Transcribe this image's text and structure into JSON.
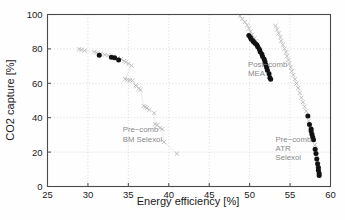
{
  "chart_data": {
    "type": "scatter",
    "title": "",
    "xlabel": "Energy efficiency [%]",
    "ylabel": "CO2 capture [%]",
    "xlim": [
      25,
      60
    ],
    "ylim": [
      0,
      100
    ],
    "xticks": [
      25,
      30,
      35,
      40,
      45,
      50,
      55,
      60
    ],
    "yticks": [
      0,
      20,
      40,
      60,
      80,
      100
    ],
    "grid": true,
    "legend_position": "inline-annotations",
    "marker_colors": {
      "light": "#b8b8b8",
      "dark": "#121212",
      "grid": "#cfcfcf",
      "axis": "#4a4a4a"
    },
    "series": [
      {
        "name": "Pre-comb BM Selexol",
        "annotation_lines": [
          "Pre−comb",
          "BM Selexol"
        ],
        "annotation_x": 34.3,
        "annotation_y": 31.5,
        "marker_light": "x",
        "marker_dark": "circle",
        "points_light": [
          [
            28.9,
            79.8
          ],
          [
            29.2,
            79.5
          ],
          [
            29.6,
            79.0
          ],
          [
            30.8,
            78.2
          ],
          [
            31.1,
            77.8
          ],
          [
            31.6,
            77.3
          ],
          [
            32.1,
            76.6
          ],
          [
            32.5,
            76.2
          ],
          [
            33.7,
            74.6
          ],
          [
            34.1,
            74.1
          ],
          [
            34.5,
            72.9
          ],
          [
            34.7,
            72.3
          ],
          [
            35.0,
            71.4
          ],
          [
            35.4,
            70.3
          ],
          [
            34.6,
            62.4
          ],
          [
            34.9,
            62.1
          ],
          [
            35.2,
            61.8
          ],
          [
            35.5,
            61.6
          ],
          [
            35.9,
            58.8
          ],
          [
            36.0,
            58.2
          ],
          [
            36.3,
            57.0
          ],
          [
            36.5,
            56.2
          ],
          [
            36.9,
            46.8
          ],
          [
            37.1,
            46.2
          ],
          [
            37.3,
            45.6
          ],
          [
            37.6,
            44.6
          ],
          [
            38.2,
            42.7
          ],
          [
            38.3,
            36.2
          ],
          [
            38.6,
            35.8
          ],
          [
            38.9,
            34.0
          ],
          [
            39.2,
            33.4
          ],
          [
            39.4,
            25.9
          ],
          [
            41.0,
            19.1
          ]
        ],
        "points_dark": [
          [
            31.4,
            76.3
          ],
          [
            32.9,
            75.2
          ],
          [
            33.3,
            74.9
          ],
          [
            33.8,
            73.6
          ]
        ]
      },
      {
        "name": "Post-comb MEA",
        "annotation_lines": [
          "Post−comb",
          "MEA"
        ],
        "annotation_x": 49.8,
        "annotation_y": 69.5,
        "marker_light": "x",
        "marker_dark": "circle",
        "points_light": [
          [
            48.8,
            99.2
          ],
          [
            49.1,
            97.4
          ],
          [
            49.4,
            95.6
          ],
          [
            49.7,
            93.8
          ],
          [
            49.9,
            91.9
          ],
          [
            50.1,
            90.0
          ],
          [
            50.3,
            88.2
          ],
          [
            50.6,
            86.2
          ],
          [
            50.8,
            84.5
          ],
          [
            51.0,
            82.8
          ],
          [
            51.2,
            80.7
          ],
          [
            51.4,
            78.5
          ],
          [
            51.6,
            76.3
          ],
          [
            51.8,
            74.2
          ],
          [
            51.9,
            72.0
          ],
          [
            52.1,
            70.0
          ],
          [
            52.2,
            67.9
          ],
          [
            52.4,
            65.8
          ],
          [
            52.5,
            63.7
          ]
        ],
        "points_dark": [
          [
            49.9,
            87.8
          ],
          [
            50.1,
            86.6
          ],
          [
            50.2,
            85.6
          ],
          [
            50.4,
            84.8
          ],
          [
            50.5,
            84.0
          ],
          [
            50.7,
            83.2
          ],
          [
            50.9,
            82.2
          ],
          [
            51.0,
            81.2
          ],
          [
            51.2,
            79.8
          ],
          [
            51.3,
            78.4
          ],
          [
            51.5,
            77.0
          ],
          [
            51.6,
            75.6
          ],
          [
            51.8,
            74.0
          ],
          [
            51.9,
            72.4
          ],
          [
            52.0,
            70.8
          ],
          [
            52.1,
            69.2
          ],
          [
            52.2,
            67.6
          ],
          [
            52.4,
            65.6
          ],
          [
            52.5,
            63.2
          ],
          [
            52.6,
            62.3
          ]
        ]
      },
      {
        "name": "Pre-comb ATR Selexol",
        "annotation_lines": [
          "Pre−comb",
          "ATR",
          "Selexol"
        ],
        "annotation_x": 53.2,
        "annotation_y": 26.0,
        "marker_light": "x",
        "marker_dark": "circle",
        "points_light": [
          [
            53.2,
            93.4
          ],
          [
            53.4,
            91.2
          ],
          [
            53.6,
            89.0
          ],
          [
            53.8,
            86.8
          ],
          [
            53.9,
            84.6
          ],
          [
            54.1,
            82.4
          ],
          [
            54.3,
            80.2
          ],
          [
            54.5,
            78.0
          ],
          [
            54.6,
            75.8
          ],
          [
            54.8,
            73.6
          ],
          [
            54.9,
            71.4
          ],
          [
            55.1,
            69.2
          ],
          [
            55.2,
            67.0
          ],
          [
            55.4,
            64.8
          ],
          [
            55.6,
            62.4
          ],
          [
            55.8,
            59.9
          ],
          [
            56.0,
            57.2
          ],
          [
            56.2,
            54.4
          ],
          [
            56.4,
            51.6
          ],
          [
            56.6,
            49.0
          ],
          [
            56.8,
            46.4
          ],
          [
            57.0,
            43.8
          ],
          [
            57.2,
            41.0
          ],
          [
            57.3,
            38.2
          ],
          [
            57.5,
            35.4
          ],
          [
            57.7,
            32.6
          ],
          [
            57.8,
            29.8
          ],
          [
            58.0,
            27.0
          ],
          [
            58.1,
            24.2
          ],
          [
            58.2,
            21.4
          ],
          [
            58.3,
            18.4
          ],
          [
            58.4,
            15.4
          ],
          [
            58.5,
            12.4
          ],
          [
            58.6,
            9.6
          ],
          [
            58.6,
            7.2
          ]
        ],
        "points_dark": [
          [
            57.2,
            41.0
          ],
          [
            57.4,
            36.0
          ],
          [
            57.6,
            33.4
          ],
          [
            57.6,
            32.2
          ],
          [
            57.7,
            30.4
          ],
          [
            57.8,
            28.8
          ],
          [
            57.9,
            27.2
          ],
          [
            58.1,
            21.6
          ],
          [
            58.2,
            19.2
          ],
          [
            58.3,
            16.0
          ],
          [
            58.4,
            13.2
          ],
          [
            58.5,
            11.0
          ],
          [
            58.5,
            9.4
          ],
          [
            58.6,
            7.6
          ],
          [
            58.6,
            6.4
          ]
        ]
      }
    ]
  }
}
